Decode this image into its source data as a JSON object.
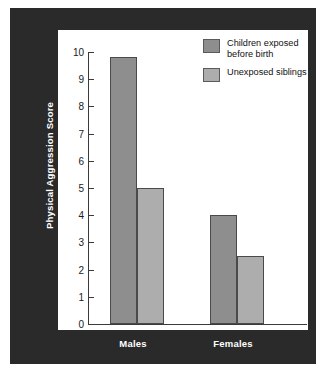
{
  "chart_data": {
    "type": "bar",
    "title": "",
    "xlabel": "",
    "ylabel": "Physical Aggression Score",
    "categories": [
      "Males",
      "Females"
    ],
    "series": [
      {
        "name": "Children exposed before birth",
        "values": [
          9.8,
          4.0
        ],
        "color": "#8e8e8e"
      },
      {
        "name": "Unexposed siblings",
        "values": [
          5.0,
          2.5
        ],
        "color": "#adadad"
      }
    ],
    "ylim": [
      0,
      10
    ],
    "yticks": [
      0,
      1,
      2,
      3,
      4,
      5,
      6,
      7,
      8,
      9,
      10
    ],
    "ytick_labels": [
      "0",
      "1",
      "2",
      "3",
      "4",
      "5",
      "6",
      "7",
      "8",
      "9",
      "10"
    ],
    "grid": false,
    "legend_position": "top-right"
  },
  "legend": {
    "items": [
      {
        "label": "Children exposed\nbefore birth",
        "color": "#8e8e8e"
      },
      {
        "label": "Unexposed siblings",
        "color": "#adadad"
      }
    ]
  },
  "colors": {
    "frame": "#2a2a2a",
    "canvas": "#ffffff",
    "axis": "#3a3a3a",
    "label_text": "#ffffff",
    "tick_text": "#1a1a1a",
    "series_1": "#8e8e8e",
    "series_2": "#adadad"
  }
}
